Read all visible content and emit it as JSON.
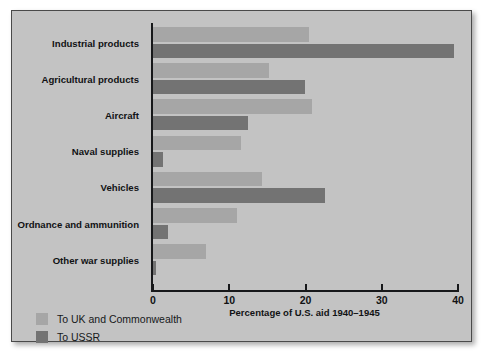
{
  "figure": {
    "background": "#ffffff",
    "panel_background": "#c3c3c3",
    "panel_border": "#4a4a4a"
  },
  "chart_data": {
    "type": "bar",
    "orientation": "horizontal",
    "title": "",
    "xlabel": "Percentage of U.S. aid 1940–1945",
    "ylabel": "",
    "xlim": [
      0,
      40
    ],
    "xticks": [
      0,
      10,
      20,
      30,
      40
    ],
    "xtick_labels": [
      "0",
      "10",
      "20",
      "30",
      "40"
    ],
    "grid": false,
    "legend_position": "bottom-left",
    "categories": [
      "Industrial products",
      "Agricultural products",
      "Aircraft",
      "Naval supplies",
      "Vehicles",
      "Ordnance and ammunition",
      "Other war supplies"
    ],
    "series": [
      {
        "name": "To UK and Commonwealth",
        "color": "#a6a6a6",
        "values": [
          20.4,
          15.2,
          20.8,
          11.6,
          14.3,
          11.0,
          7.0
        ]
      },
      {
        "name": "To USSR",
        "color": "#737373",
        "values": [
          39.5,
          19.9,
          12.5,
          1.3,
          22.6,
          2.0,
          0.4
        ]
      }
    ]
  },
  "axis": {
    "tick_color": "#17181a",
    "label_color": "#111214"
  },
  "legend": {
    "items": [
      {
        "label": "To UK and Commonwealth",
        "color": "#a6a6a6"
      },
      {
        "label": "To USSR",
        "color": "#737373"
      }
    ]
  }
}
